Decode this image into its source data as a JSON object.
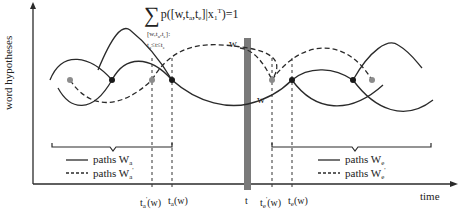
{
  "formula": {
    "sum_symbol": "∑",
    "expression": "p([w,t",
    "sub_a": "a",
    "mid": ",t",
    "sub_e": "e",
    "close": "]|x",
    "x_sub": "1",
    "x_sup": "T",
    "tail": ")=1",
    "index_line1": "[w,t",
    "index_a": "a",
    "index_mid": ",t",
    "index_e": "e",
    "index_close": "]:",
    "index_line2a": "t",
    "index_line2b": "≤t≤t"
  },
  "axes": {
    "y_label": "word hypotheses",
    "x_label": "time"
  },
  "labels": {
    "w_upper": "w",
    "w_lower": "w"
  },
  "legend_left": {
    "solid_label": "paths W",
    "solid_sub": "a",
    "dashed_label": "paths W",
    "dashed_sub": "a",
    "dashed_sup": "'"
  },
  "legend_right": {
    "solid_label": "paths W",
    "solid_sub": "e",
    "dashed_label": "paths W",
    "dashed_sub": "e",
    "dashed_sup": "'"
  },
  "ticks": [
    {
      "base": "t",
      "sub": "a",
      "prime": "'",
      "arg": "(w)"
    },
    {
      "base": "t",
      "sub": "a",
      "prime": "",
      "arg": "(w)"
    },
    {
      "base": "t",
      "sub": "",
      "prime": "",
      "arg": ""
    },
    {
      "base": "t",
      "sub": "e",
      "prime": "'",
      "arg": "(w)"
    },
    {
      "base": "t",
      "sub": "e",
      "prime": "",
      "arg": "(w)"
    }
  ],
  "colors": {
    "line": "#2a2a2a",
    "bar": "#7a7a7a",
    "gray_node": "#8c8c8c",
    "black_node": "#1a1a1a"
  }
}
